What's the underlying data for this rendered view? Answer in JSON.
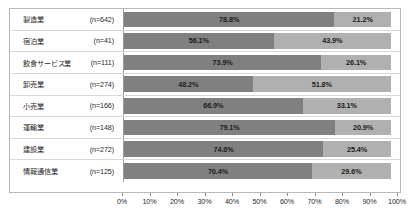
{
  "chart_data": {
    "type": "bar",
    "orientation": "horizontal",
    "stacked": true,
    "normalized_percent": true,
    "title": "",
    "xlabel": "",
    "ylabel": "",
    "xlim": [
      0,
      100
    ],
    "grid": false,
    "legend_position": "none",
    "categories": [
      "製造業",
      "宿泊業",
      "飲食サービス業",
      "卸売業",
      "小売業",
      "運輸業",
      "建設業",
      "情報通信業"
    ],
    "sample_sizes": [
      "(n=642)",
      "(n=41)",
      "(n=111)",
      "(n=274)",
      "(n=166)",
      "(n=148)",
      "(n=272)",
      "(n=125)"
    ],
    "series": [
      {
        "name": "series-a",
        "color": "#808080",
        "values": [
          78.8,
          56.1,
          73.9,
          48.2,
          66.9,
          79.1,
          74.6,
          70.4
        ],
        "labels": [
          "78.8%",
          "56.1%",
          "73.9%",
          "48.2%",
          "66.9%",
          "79.1%",
          "74.6%",
          "70.4%"
        ]
      },
      {
        "name": "series-b",
        "color": "#b0b0b0",
        "values": [
          21.2,
          43.9,
          26.1,
          51.8,
          33.1,
          20.9,
          25.4,
          29.6
        ],
        "labels": [
          "21.2%",
          "43.9%",
          "26.1%",
          "51.8%",
          "33.1%",
          "20.9%",
          "25.4%",
          "29.6%"
        ]
      }
    ],
    "x_ticks": [
      0,
      10,
      20,
      30,
      40,
      50,
      60,
      70,
      80,
      90,
      100
    ],
    "x_tick_labels": [
      "0%",
      "10%",
      "20%",
      "30%",
      "40%",
      "50%",
      "60%",
      "70%",
      "80%",
      "90%",
      "100%"
    ]
  },
  "colors": {
    "series_a": "#808080",
    "series_b": "#b0b0b0",
    "frame_border": "#b9b9b9",
    "row_divider": "#d8d8d8",
    "axis_line": "#9a9a9a",
    "text": "#2b2b2b"
  }
}
